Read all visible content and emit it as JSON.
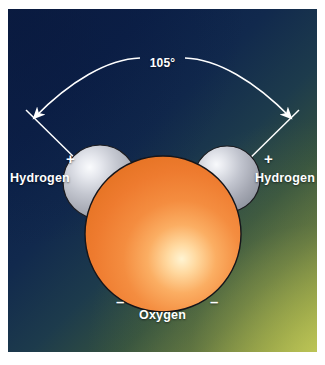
{
  "figure": {
    "frame_color": "#ffffff",
    "background": {
      "top_left_color": "#0b1e44",
      "bottom_right_color": "#b9bf55",
      "style": "diagonal-gradient"
    }
  },
  "angle": {
    "value": "105°",
    "arc_color": "#ffffff"
  },
  "atoms": {
    "oxygen": {
      "label": "Oxygen",
      "color": "#ef7f36",
      "highlight_color": "#ffe9b0",
      "charge_signs": [
        "–",
        "–"
      ]
    },
    "hydrogen_left": {
      "label": "Hydrogen",
      "color": "#b9bcc4",
      "highlight_color": "#f1f2f5",
      "charge_sign": "+"
    },
    "hydrogen_right": {
      "label": "Hydrogen",
      "color": "#b9bcc4",
      "highlight_color": "#f1f2f5",
      "charge_sign": "+"
    }
  }
}
